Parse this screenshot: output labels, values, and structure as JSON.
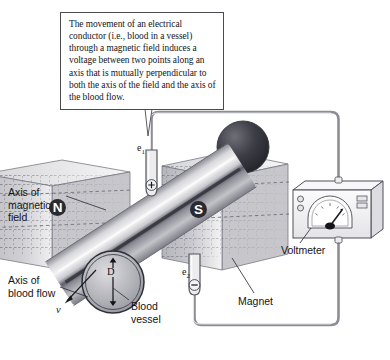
{
  "figure": {
    "background": "#ffffff"
  },
  "caption": {
    "text": "The movement of an electrical conductor (i.e., blood in a vessel) through a magnetic field induces a voltage between two points along an axis that is mutually perpendicular to both the axis of the field and the axis of the blood flow."
  },
  "labels": {
    "axis_of_magnetic_field": "Axis of\nmagnetic\nfield",
    "axis_of_blood_flow": "Axis of\nblood flow",
    "blood_vessel": "Blood\nvessel",
    "magnet": "Magnet",
    "voltmeter": "Voltmeter"
  },
  "symbols": {
    "electrode_1": "e",
    "electrode_1_sub": "1",
    "electrode_2": "e",
    "electrode_2_sub": "2",
    "velocity": "v",
    "diameter": "D",
    "polarity_positive": "+",
    "polarity_negative": "−"
  },
  "poles": {
    "north": "N",
    "south": "S"
  },
  "colors": {
    "outline": "#4a4a55",
    "wire": "#8d8d98",
    "magnet_fill": "#b8b8bd",
    "cylinder_light": "#f2f2f4",
    "cylinder_dark": "#3a3a42",
    "pole_badge": "#2a2a30",
    "text": "#141418"
  }
}
